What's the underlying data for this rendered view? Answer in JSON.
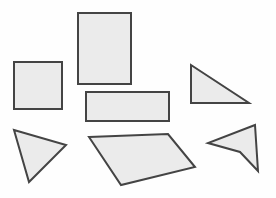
{
  "figure": {
    "width": 276,
    "height": 198,
    "background_color": "#fefefe",
    "default_fill": "#ebebeb",
    "default_stroke": "#444444",
    "default_stroke_width": 2
  },
  "shapes": [
    {
      "name": "square-left",
      "kind": "square",
      "fill": "#ebebeb",
      "stroke": "#444444",
      "stroke_width": 2,
      "points": "14,62 62,62 62,109 14,109"
    },
    {
      "name": "rectangle-tall-top",
      "kind": "rectangle",
      "fill": "#ebebeb",
      "stroke": "#444444",
      "stroke_width": 2,
      "points": "78,13 131,13 131,84 78,84"
    },
    {
      "name": "rectangle-wide-center",
      "kind": "rectangle",
      "fill": "#ebebeb",
      "stroke": "#444444",
      "stroke_width": 2,
      "points": "86,92 169,92 169,121 86,121"
    },
    {
      "name": "right-triangle-upper-right",
      "kind": "triangle",
      "fill": "#ebebeb",
      "stroke": "#444444",
      "stroke_width": 2,
      "points": "191,65 249,103 191,103"
    },
    {
      "name": "triangle-lower-left",
      "kind": "triangle",
      "fill": "#ebebeb",
      "stroke": "#444444",
      "stroke_width": 2,
      "points": "14,130 66,145 29,182"
    },
    {
      "name": "quadrilateral-center-bottom",
      "kind": "quadrilateral",
      "fill": "#ebebeb",
      "stroke": "#444444",
      "stroke_width": 2,
      "points": "89,137 168,134 195,167 121,185"
    },
    {
      "name": "arrowhead-lower-right",
      "kind": "concave-quadrilateral",
      "fill": "#ebebeb",
      "stroke": "#444444",
      "stroke_width": 2,
      "points": "255,125 258,171 240,152 208,143"
    }
  ]
}
